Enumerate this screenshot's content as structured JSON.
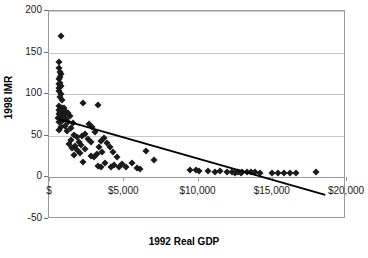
{
  "chart_data": {
    "type": "scatter",
    "title": "",
    "xlabel": "1992 Real GDP",
    "ylabel": "1998 IMR",
    "xlim": [
      0,
      20000
    ],
    "ylim": [
      -50,
      200
    ],
    "grid": true,
    "legend": "none",
    "x_ticks": [
      {
        "value": 0,
        "label": "$"
      },
      {
        "value": 5000,
        "label": "$5,000"
      },
      {
        "value": 10000,
        "label": "$10,000"
      },
      {
        "value": 15000,
        "label": "$15,000"
      },
      {
        "value": 20000,
        "label": "$20,000"
      }
    ],
    "y_ticks": [
      {
        "value": 200,
        "label": "200"
      },
      {
        "value": 150,
        "label": "150"
      },
      {
        "value": 100,
        "label": "100"
      },
      {
        "value": 50,
        "label": "50"
      },
      {
        "value": 0,
        "label": "0"
      },
      {
        "value": -50,
        "label": "-50"
      }
    ],
    "marker": {
      "shape": "diamond",
      "color": "#1a1a1a",
      "size": 5
    },
    "trendline": {
      "type": "linear",
      "color": "#000000",
      "width": 2,
      "x_start": 700,
      "y_start": 70,
      "x_end": 18600,
      "y_end": -21
    },
    "points": [
      [
        800,
        170
      ],
      [
        650,
        139
      ],
      [
        700,
        131
      ],
      [
        760,
        127
      ],
      [
        800,
        124
      ],
      [
        720,
        121
      ],
      [
        690,
        118
      ],
      [
        740,
        114
      ],
      [
        660,
        112
      ],
      [
        780,
        110
      ],
      [
        700,
        108
      ],
      [
        640,
        104
      ],
      [
        820,
        100
      ],
      [
        760,
        97
      ],
      [
        900,
        93
      ],
      [
        2300,
        90
      ],
      [
        3300,
        87
      ],
      [
        700,
        86
      ],
      [
        860,
        84
      ],
      [
        980,
        83
      ],
      [
        640,
        81
      ],
      [
        1100,
        80
      ],
      [
        760,
        79
      ],
      [
        1250,
        78
      ],
      [
        880,
        77
      ],
      [
        700,
        76
      ],
      [
        1000,
        75
      ],
      [
        1400,
        74
      ],
      [
        800,
        72
      ],
      [
        620,
        71
      ],
      [
        1150,
        70
      ],
      [
        900,
        68
      ],
      [
        700,
        67
      ],
      [
        1300,
        66
      ],
      [
        1600,
        65
      ],
      [
        2700,
        64
      ],
      [
        1050,
        62
      ],
      [
        800,
        61
      ],
      [
        2900,
        60
      ],
      [
        1450,
        59
      ],
      [
        640,
        57
      ],
      [
        1200,
        56
      ],
      [
        3100,
        55
      ],
      [
        2400,
        52
      ],
      [
        1700,
        51
      ],
      [
        2200,
        50
      ],
      [
        1900,
        48
      ],
      [
        3700,
        47
      ],
      [
        2600,
        46
      ],
      [
        1500,
        45
      ],
      [
        3500,
        44
      ],
      [
        2000,
        43
      ],
      [
        2800,
        42
      ],
      [
        3900,
        41
      ],
      [
        1350,
        40
      ],
      [
        2150,
        39
      ],
      [
        1750,
        38
      ],
      [
        3400,
        37
      ],
      [
        4100,
        36
      ],
      [
        1550,
        35
      ],
      [
        2450,
        34
      ],
      [
        1900,
        33
      ],
      [
        6500,
        32
      ],
      [
        3600,
        31
      ],
      [
        4300,
        30
      ],
      [
        2100,
        29
      ],
      [
        3200,
        28
      ],
      [
        1650,
        27
      ],
      [
        2800,
        26
      ],
      [
        4600,
        25
      ],
      [
        3000,
        24
      ],
      [
        7100,
        21
      ],
      [
        2300,
        18
      ],
      [
        3800,
        17
      ],
      [
        5600,
        17
      ],
      [
        4900,
        16
      ],
      [
        4400,
        15
      ],
      [
        3300,
        14
      ],
      [
        4200,
        13
      ],
      [
        5200,
        13
      ],
      [
        3500,
        12
      ],
      [
        4700,
        12
      ],
      [
        5900,
        11
      ],
      [
        6100,
        10
      ],
      [
        9500,
        9
      ],
      [
        9900,
        9
      ],
      [
        10100,
        8
      ],
      [
        11500,
        8
      ],
      [
        12000,
        7
      ],
      [
        12300,
        7
      ],
      [
        12700,
        6
      ],
      [
        13000,
        6
      ],
      [
        13300,
        6
      ],
      [
        13600,
        6
      ],
      [
        13900,
        6
      ],
      [
        14200,
        5
      ],
      [
        15000,
        5
      ],
      [
        15400,
        5
      ],
      [
        15800,
        5
      ],
      [
        16200,
        5
      ],
      [
        16600,
        5
      ],
      [
        18000,
        6
      ],
      [
        12500,
        5
      ],
      [
        12900,
        5
      ],
      [
        11200,
        7
      ],
      [
        10700,
        8
      ]
    ]
  }
}
